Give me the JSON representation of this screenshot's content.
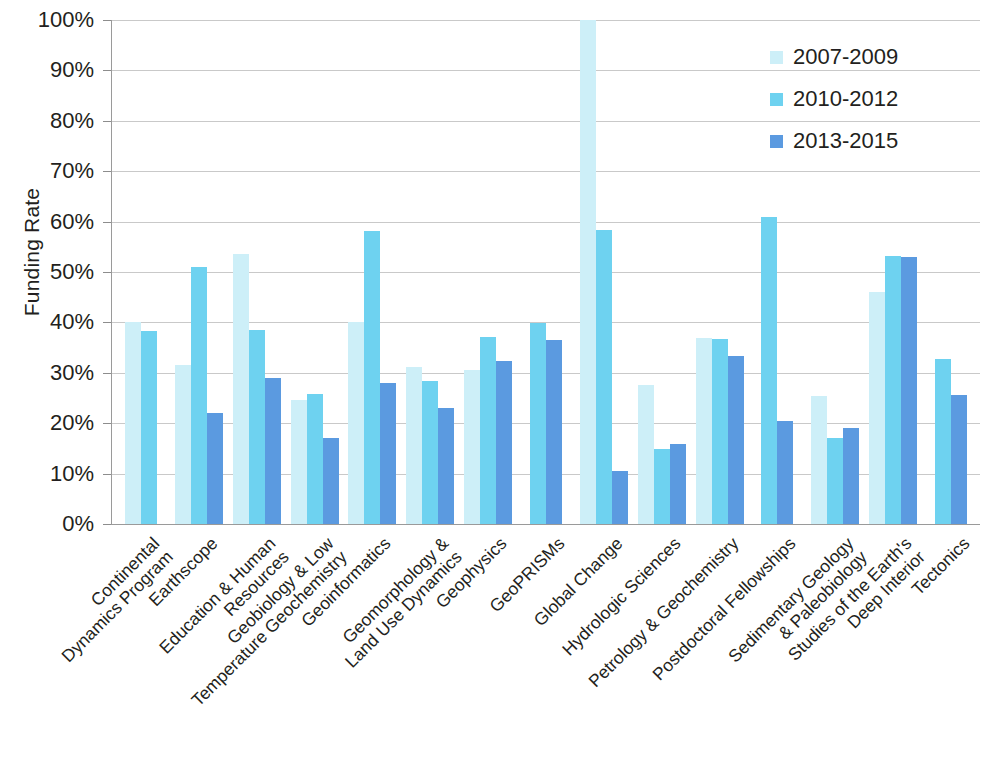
{
  "chart_data": {
    "type": "bar",
    "title": "",
    "xlabel": "",
    "ylabel": "Funding Rate",
    "ylim": [
      0,
      100
    ],
    "ytick_labels": [
      "100%",
      "90%",
      "80%",
      "70%",
      "60%",
      "50%",
      "40%",
      "30%",
      "20%",
      "10%",
      "0%"
    ],
    "ytick_values": [
      100,
      90,
      80,
      70,
      60,
      50,
      40,
      30,
      20,
      10,
      0
    ],
    "grid": true,
    "legend_position": "top-right",
    "colors": {
      "2007-2009": "#cdeff8",
      "2010-2012": "#6ed2f0",
      "2013-2015": "#5b9ae0"
    },
    "categories": [
      "Continental\nDynamics Program",
      "Earthscope",
      "Education & Human Resources",
      "Geobiology & Low\nTemperature Geochemistry",
      "Geoinformatics",
      "Geomorphology &\nLand Use Dynamics",
      "Geophysics",
      "GeoPRISMs",
      "Global Change",
      "Hydrologic Sciences",
      "Petrology & Geochemistry",
      "Postdoctoral Fellowships",
      "Sedimentary Geology\n& Paleobiology",
      "Studies of the Earth's\nDeep Interior",
      "Tectonics"
    ],
    "series": [
      {
        "name": "2007-2009",
        "color": "#cdeff8",
        "values": [
          40.0,
          31.6,
          53.5,
          24.7,
          40.0,
          31.2,
          30.5,
          null,
          100.0,
          27.6,
          37.0,
          null,
          25.4,
          46.0,
          null
        ]
      },
      {
        "name": "2010-2012",
        "color": "#6ed2f0",
        "values": [
          38.3,
          51.0,
          38.4,
          25.8,
          58.2,
          28.4,
          37.1,
          39.9,
          58.4,
          14.9,
          36.8,
          61.0,
          17.1,
          53.2,
          32.8
        ]
      },
      {
        "name": "2013-2015",
        "color": "#5b9ae0",
        "values": [
          null,
          22.0,
          28.9,
          17.0,
          28.0,
          23.1,
          32.4,
          36.5,
          10.5,
          15.8,
          33.3,
          20.4,
          19.0,
          52.9,
          25.5
        ]
      }
    ]
  },
  "legend": {
    "items": [
      {
        "label": "2007-2009",
        "color": "#cdeff8"
      },
      {
        "label": "2010-2012",
        "color": "#6ed2f0"
      },
      {
        "label": "2013-2015",
        "color": "#5b9ae0"
      }
    ]
  }
}
